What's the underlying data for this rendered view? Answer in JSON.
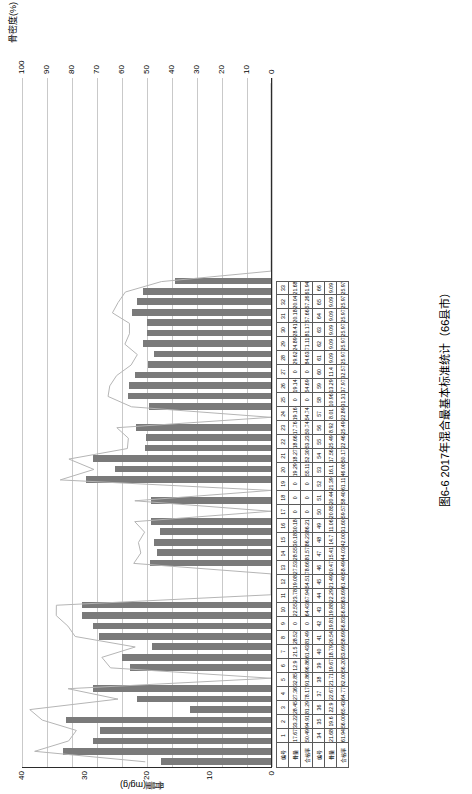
{
  "figure": {
    "caption": "图6-6  2017年混合最基本标准统计（66县市）",
    "y_axis_left_title": "骨量(mg/g)",
    "y_axis_right_title": "骨密度(%)",
    "y_left_ticks": [
      "0",
      "10",
      "20",
      "30",
      "40"
    ],
    "y_right_ticks": [
      "0",
      "10",
      "20",
      "30",
      "40",
      "50",
      "60",
      "70",
      "80",
      "90",
      "100"
    ],
    "y_left_range": [
      0,
      40
    ],
    "y_right_range": [
      0,
      100
    ]
  },
  "chart_data": {
    "type": "bar",
    "title": "图6-6  2017年混合最基本标准统计（66县市）",
    "xlabel": "",
    "ylabel": "骨量(mg/g)",
    "y2label": "骨密度(%)",
    "ylim": [
      0,
      40
    ],
    "y2lim": [
      0,
      100
    ],
    "grid": true,
    "legend": [
      "骨量",
      "合格率"
    ],
    "categories": [
      "1",
      "2",
      "3",
      "4",
      "5",
      "6",
      "7",
      "8",
      "9",
      "10",
      "11",
      "12",
      "13",
      "14",
      "15",
      "16",
      "17",
      "18",
      "19",
      "20",
      "21",
      "22",
      "23",
      "24",
      "25",
      "26",
      "27",
      "28",
      "29",
      "30",
      "31",
      "32",
      "33",
      "34",
      "35",
      "36",
      "37",
      "38",
      "39",
      "40",
      "41",
      "42",
      "43",
      "44",
      "45",
      "46",
      "47",
      "48",
      "49",
      "50",
      "51",
      "52",
      "53",
      "54",
      "55",
      "56",
      "57",
      "58",
      "59",
      "60",
      "61",
      "62",
      "63",
      "64",
      "65",
      "66"
    ],
    "series": [
      {
        "name": "骨量(mg/g)",
        "kind": "bar",
        "values": [
          17.67,
          33.22,
          28.45,
          27.36,
          32.85,
          12.9,
          21.5,
          28.52,
          0,
          22.55,
          23.78,
          19.08,
          27.53,
          28.55,
          30.18,
          30.18,
          0,
          0,
          0,
          19.29,
          18.27,
          18.66,
          17.76,
          19.16,
          0,
          19.14,
          0,
          29.62,
          24.89,
          28.41,
          20.18,
          20.04,
          21.68,
          0,
          19.6,
          22.9,
          22.67,
          21.71,
          19.67,
          18.79,
          20.54,
          19.81,
          19.88,
          22.29,
          21.49,
          20.47,
          15.41,
          0,
          0,
          0,
          0,
          0,
          0,
          0,
          0,
          0,
          0,
          0,
          0,
          0,
          0,
          0,
          0,
          0,
          0,
          0
        ]
      },
      {
        "name": "合格率(%)",
        "kind": "line",
        "values": [
          50.49,
          94.91,
          81.29,
          78.17,
          91.86,
          96.86,
          61.43,
          81.49,
          0,
          64.43,
          67.94,
          54.51,
          78.66,
          81.57,
          86.23,
          86.21,
          0,
          0,
          0,
          55.11,
          52.3,
          53.23,
          50.74,
          54.74,
          0,
          54.69,
          0,
          84.63,
          71.11,
          81.17,
          57.66,
          57.26,
          61.94,
          0,
          56.0,
          65.43,
          64.77,
          62.0,
          56.2,
          53.69,
          58.69,
          56.83,
          56.83,
          63.69,
          61.4,
          58.49,
          44.03,
          0,
          0,
          0,
          0,
          0,
          0,
          0,
          0,
          0,
          0,
          0,
          0,
          0,
          0,
          0,
          0,
          0,
          0,
          0
        ]
      }
    ]
  },
  "bar_values_rendered": [
    {
      "i": 1,
      "v": 17.67
    },
    {
      "i": 2,
      "v": 33.22
    },
    {
      "i": 3,
      "v": 28.45
    },
    {
      "i": 4,
      "v": 27.36
    },
    {
      "i": 5,
      "v": 32.85
    },
    {
      "i": 6,
      "v": 12.9
    },
    {
      "i": 7,
      "v": 21.5
    },
    {
      "i": 8,
      "v": 28.52
    },
    {
      "i": 10,
      "v": 22.55
    },
    {
      "i": 11,
      "v": 23.78
    },
    {
      "i": 12,
      "v": 19.08
    },
    {
      "i": 13,
      "v": 27.53
    },
    {
      "i": 14,
      "v": 28.55
    },
    {
      "i": 15,
      "v": 30.18
    },
    {
      "i": 16,
      "v": 30.18
    },
    {
      "i": 20,
      "v": 19.29
    },
    {
      "i": 21,
      "v": 18.27
    },
    {
      "i": 22,
      "v": 18.66
    },
    {
      "i": 23,
      "v": 17.76
    },
    {
      "i": 24,
      "v": 19.16
    },
    {
      "i": 26,
      "v": 19.14
    },
    {
      "i": 28,
      "v": 29.62
    },
    {
      "i": 29,
      "v": 24.89
    },
    {
      "i": 30,
      "v": 28.41
    },
    {
      "i": 31,
      "v": 20.18
    },
    {
      "i": 32,
      "v": 20.04
    },
    {
      "i": 33,
      "v": 21.68
    },
    {
      "i": 35,
      "v": 19.6
    },
    {
      "i": 36,
      "v": 22.9
    },
    {
      "i": 37,
      "v": 22.67
    },
    {
      "i": 38,
      "v": 21.71
    },
    {
      "i": 39,
      "v": 19.67
    },
    {
      "i": 40,
      "v": 18.79
    },
    {
      "i": 41,
      "v": 20.54
    },
    {
      "i": 42,
      "v": 19.81
    },
    {
      "i": 43,
      "v": 19.88
    },
    {
      "i": 44,
      "v": 22.29
    },
    {
      "i": 45,
      "v": 21.49
    },
    {
      "i": 46,
      "v": 20.47
    },
    {
      "i": 47,
      "v": 15.41
    }
  ],
  "table": {
    "row_labels": [
      "编号",
      "骨量",
      "合格率",
      "编号",
      "骨量",
      "合格率"
    ],
    "blocks": [
      {
        "index_label": "编号",
        "mass_label": "骨量",
        "rate_label": "合格率",
        "indices": [
          "1",
          "2",
          "3",
          "4",
          "5",
          "6",
          "7",
          "8",
          "9",
          "10",
          "11",
          "12",
          "13",
          "14",
          "15",
          "16",
          "17",
          "18",
          "19",
          "20",
          "21",
          "22",
          "23",
          "24",
          "25",
          "26",
          "27",
          "28",
          "29",
          "30",
          "31",
          "32",
          "33"
        ],
        "mass": [
          "17.67",
          "33.22",
          "28.45",
          "27.36",
          "32.85",
          "12.9",
          "21.5",
          "28.52",
          "0",
          "22.55",
          "23.78",
          "19.08",
          "27.53",
          "28.55",
          "30.18",
          "30.18",
          "0",
          "0",
          "0",
          "19.29",
          "18.27",
          "18.66",
          "17.76",
          "19.16",
          "0",
          "19.14",
          "0",
          "29.62",
          "24.89",
          "28.41",
          "20.18",
          "20.04",
          "21.68"
        ],
        "rate": [
          "50.49",
          "94.91",
          "81.29",
          "78.17",
          "91.86",
          "96.86",
          "61.43",
          "81.49",
          "0",
          "64.43",
          "67.94",
          "54.51",
          "78.66",
          "81.57",
          "86.23",
          "86.21",
          "0",
          "0",
          "0",
          "55.11",
          "52.30",
          "53.23",
          "50.74",
          "54.74",
          "0",
          "54.69",
          "0",
          "84.63",
          "71.11",
          "81.17",
          "57.66",
          "57.26",
          "61.94"
        ]
      },
      {
        "index_label": "编号",
        "mass_label": "骨量",
        "rate_label": "合格率",
        "indices": [
          "34",
          "35",
          "36",
          "37",
          "38",
          "39",
          "40",
          "41",
          "42",
          "43",
          "44",
          "45",
          "46",
          "47",
          "48",
          "49",
          "50",
          "51",
          "52",
          "53",
          "54",
          "55",
          "56",
          "57",
          "58",
          "59",
          "60",
          "61",
          "62",
          "63",
          "64",
          "65",
          "66"
        ],
        "count": [
          "34",
          "36",
          "37",
          "38",
          "39",
          "40",
          "41",
          "42",
          "43",
          "44",
          "45",
          "46",
          "47",
          "48",
          "49",
          "50",
          "51",
          "52",
          "53",
          "54",
          "55",
          "56",
          "57",
          "58",
          "59",
          "60",
          "61",
          "62",
          "63",
          "64",
          "65",
          "66"
        ],
        "mass": [
          "21.68",
          "19.6",
          "22.9",
          "22.67",
          "21.71",
          "19.67",
          "18.79",
          "20.54",
          "19.81",
          "19.88",
          "22.29",
          "21.49",
          "20.47",
          "15.41",
          "14.7",
          "11.06",
          "20.85",
          "20.44",
          "21.39",
          "16.1",
          "17.56",
          "25.49",
          "8.92",
          "8.01",
          "10.96",
          "13.29",
          "11.4",
          "9.09",
          "9.09",
          "9.09",
          "9.09",
          "9.09",
          "9.09"
        ],
        "rate": [
          "61.94",
          "56.00",
          "65.43",
          "64.77",
          "62.00",
          "56.20",
          "53.69",
          "58.69",
          "56.83",
          "56.83",
          "63.69",
          "61.40",
          "58.49",
          "44.03",
          "42.00",
          "31.60",
          "59.57",
          "58.40",
          "61.11",
          "46.00",
          "50.17",
          "22.46",
          "25.49",
          "22.89",
          "31.31",
          "37.97",
          "32.57",
          "25.97",
          "25.97",
          "25.97",
          "25.97",
          "25.97",
          "25.97"
        ]
      }
    ],
    "header_rows_raw": {
      "row1_indices": [
        "1",
        "2",
        "3",
        "4",
        "5",
        "6",
        "7",
        "8",
        "9",
        "10",
        "11",
        "12",
        "13",
        "14",
        "15",
        "16",
        "17",
        "18",
        "19",
        "20",
        "21",
        "22",
        "23",
        "24",
        "25",
        "26",
        "27",
        "28",
        "29",
        "30",
        "31",
        "32",
        "33"
      ],
      "row2_mass": [
        "17.67",
        "33.22",
        "28.45",
        "27.36",
        "32.85",
        "12.9",
        "21.5",
        "28.52",
        "0",
        "22.55",
        "23.78",
        "19.08",
        "27.53",
        "28.55",
        "30.18",
        "30.18",
        "0",
        "0",
        "0",
        "19.29",
        "18.27",
        "18.66",
        "17.76",
        "19.16",
        "0",
        "19.14",
        "0",
        "29.62",
        "24.89",
        "28.41",
        "20.18",
        "20.04",
        "21.68"
      ],
      "row3_rate": [
        "50.49",
        "94.91",
        "81.29",
        "78.17",
        "91.86",
        "96.86",
        "61.43",
        "81.49",
        "0",
        "64.43",
        "67.94",
        "54.51",
        "78.66",
        "81.57",
        "86.23",
        "86.21",
        "0",
        "0",
        "0",
        "55.11",
        "52.30",
        "53.23",
        "50.74",
        "54.74",
        "0",
        "54.69",
        "0",
        "84.63",
        "71.11",
        "81.17",
        "57.66",
        "57.26",
        "61.94"
      ],
      "row4_indices": [
        "34",
        "35",
        "36",
        "37",
        "38",
        "39",
        "40",
        "41",
        "42",
        "43",
        "44",
        "45",
        "46",
        "47",
        "48",
        "49",
        "50",
        "51",
        "52",
        "53",
        "54",
        "55",
        "56",
        "57",
        "58",
        "59",
        "60",
        "61",
        "62",
        "63",
        "64",
        "65",
        "66"
      ],
      "row5_mass": [
        "21.68",
        "19.6",
        "22.9",
        "22.67",
        "21.71",
        "19.67",
        "18.79",
        "20.54",
        "19.81",
        "19.88",
        "22.29",
        "21.49",
        "20.47",
        "15.41",
        "14.7",
        "11.06",
        "20.85",
        "20.44",
        "21.39",
        "16.1",
        "17.56",
        "25.49",
        "8.92",
        "8.01",
        "10.96",
        "13.29",
        "11.4",
        "9.09",
        "9.09",
        "9.09",
        "9.09",
        "9.09",
        "9.09"
      ],
      "row6_rate": [
        "61.94",
        "56.00",
        "65.43",
        "64.77",
        "62.00",
        "56.20",
        "53.69",
        "58.69",
        "56.83",
        "56.83",
        "63.69",
        "61.40",
        "58.49",
        "44.03",
        "42.00",
        "31.60",
        "59.57",
        "58.40",
        "61.11",
        "46.00",
        "50.17",
        "22.46",
        "25.49",
        "22.89",
        "31.31",
        "37.97",
        "32.57",
        "25.97",
        "25.97",
        "25.97",
        "25.97",
        "25.97",
        "25.97"
      ]
    }
  },
  "colors": {
    "bar": "#7a7a7a",
    "line": "#b5b5b5",
    "grid": "#c9c9c9",
    "axis": "#2b2b2b",
    "table_border": "#5a5a5a"
  }
}
